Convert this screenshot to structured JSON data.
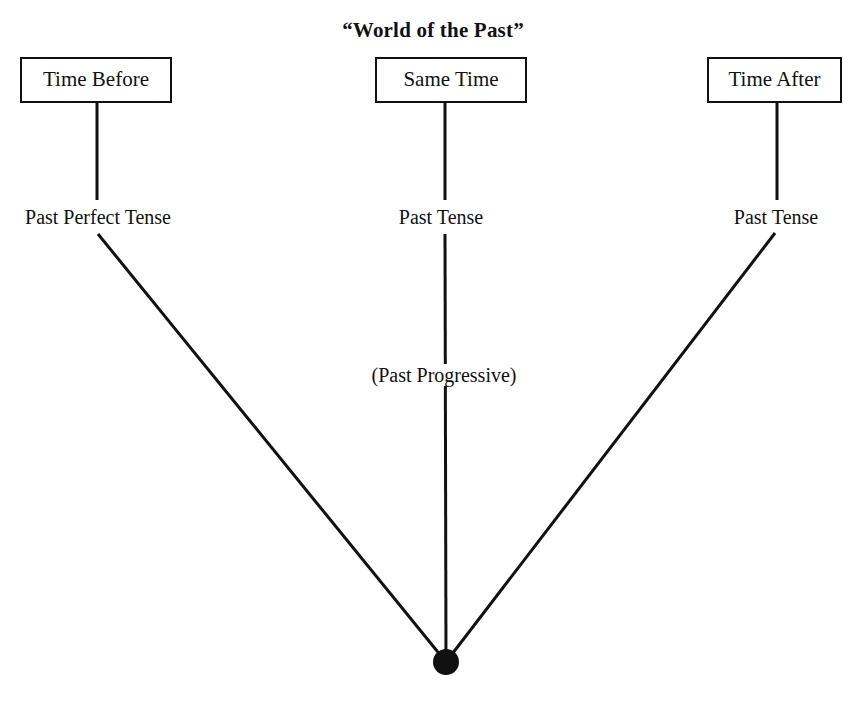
{
  "figure": {
    "title": "“World of the Past”",
    "clipped_caption_fragment": "",
    "type": "timeline-convergence-diagram"
  },
  "boxes": [
    {
      "id": "time-before",
      "label": "Time Before"
    },
    {
      "id": "same-time",
      "label": "Same Time"
    },
    {
      "id": "time-after",
      "label": "Time After"
    }
  ],
  "labels": [
    {
      "id": "past-perfect-tense",
      "text": "Past Perfect Tense"
    },
    {
      "id": "past-tense-middle",
      "text": "Past Tense"
    },
    {
      "id": "past-tense-right",
      "text": "Past Tense"
    },
    {
      "id": "past-progressive-option",
      "text": "(Past Progressive)"
    }
  ],
  "colors": {
    "ink": "#111111",
    "background": "#ffffff"
  },
  "geometry": {
    "convergence_point": {
      "x": 446,
      "y": 662,
      "radius": 13
    },
    "connectors": [
      {
        "from": "time-before",
        "x": 97,
        "y1": 103,
        "y2": 200
      },
      {
        "from": "same-time",
        "x": 445,
        "y1": 103,
        "y2": 200
      },
      {
        "from": "time-after",
        "x": 777,
        "y1": 103,
        "y2": 200
      }
    ],
    "rays": [
      {
        "from": "past-perfect-tense",
        "x1": 98,
        "y1": 234,
        "x2": 446,
        "y2": 662
      },
      {
        "from": "past-tense-middle",
        "x1": 445,
        "y1": 234,
        "x2": 446,
        "y2": 662
      },
      {
        "from": "past-tense-right",
        "x1": 775,
        "y1": 233,
        "x2": 446,
        "y2": 662
      }
    ]
  }
}
